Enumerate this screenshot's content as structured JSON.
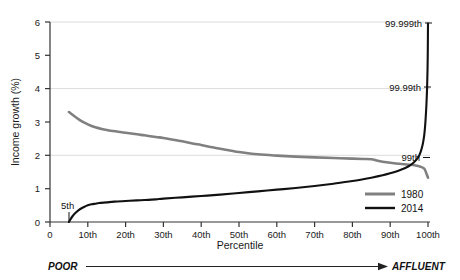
{
  "chart_data": {
    "type": "line",
    "title": "",
    "xlabel": "Percentile",
    "ylabel": "Income growth (%)",
    "xlim": [
      0,
      100
    ],
    "ylim": [
      0,
      6
    ],
    "grid": true,
    "legend_position": "bottom-right",
    "x_ticks": [
      {
        "value": 0,
        "label": "0"
      },
      {
        "value": 10,
        "label": "10th"
      },
      {
        "value": 20,
        "label": "20th"
      },
      {
        "value": 30,
        "label": "30th"
      },
      {
        "value": 40,
        "label": "40th"
      },
      {
        "value": 50,
        "label": "50th"
      },
      {
        "value": 60,
        "label": "60th"
      },
      {
        "value": 70,
        "label": "70th"
      },
      {
        "value": 80,
        "label": "80th"
      },
      {
        "value": 90,
        "label": "90th"
      },
      {
        "value": 100,
        "label": "100th"
      }
    ],
    "y_ticks": [
      {
        "value": 0,
        "label": "0"
      },
      {
        "value": 1,
        "label": "1"
      },
      {
        "value": 2,
        "label": "2"
      },
      {
        "value": 3,
        "label": "3"
      },
      {
        "value": 4,
        "label": "4"
      },
      {
        "value": 5,
        "label": "5"
      },
      {
        "value": 6,
        "label": "6"
      }
    ],
    "gridlines_y": [
      2,
      4,
      6
    ],
    "series": [
      {
        "name": "1980",
        "color": "#808080",
        "x": [
          5,
          8,
          10,
          12,
          14,
          15,
          16,
          18,
          20,
          23,
          25,
          28,
          30,
          33,
          35,
          38,
          40,
          43,
          45,
          48,
          50,
          55,
          60,
          65,
          70,
          75,
          80,
          83,
          85,
          87,
          89,
          91,
          93,
          95,
          96,
          97,
          98,
          99,
          99.5,
          100
        ],
        "values": [
          3.3,
          3.05,
          2.93,
          2.84,
          2.78,
          2.76,
          2.74,
          2.71,
          2.68,
          2.63,
          2.6,
          2.55,
          2.52,
          2.46,
          2.42,
          2.35,
          2.31,
          2.24,
          2.2,
          2.14,
          2.1,
          2.03,
          1.99,
          1.96,
          1.94,
          1.92,
          1.9,
          1.89,
          1.88,
          1.83,
          1.79,
          1.76,
          1.74,
          1.72,
          1.71,
          1.69,
          1.66,
          1.6,
          1.48,
          1.33
        ]
      },
      {
        "name": "2014",
        "color": "#111111",
        "x": [
          5,
          6,
          7,
          8,
          9,
          10,
          11,
          12,
          13,
          15,
          17,
          20,
          23,
          25,
          28,
          30,
          35,
          40,
          45,
          50,
          55,
          60,
          65,
          70,
          75,
          80,
          85,
          88,
          90,
          92,
          94,
          95,
          96,
          97,
          97.6,
          98.1,
          98.5,
          98.8,
          99.05,
          99.25,
          99.4,
          99.55,
          99.65,
          99.75,
          99.82,
          99.88,
          99.92,
          99.95,
          99.97,
          99.985,
          100
        ],
        "values": [
          0.0,
          0.18,
          0.3,
          0.39,
          0.45,
          0.5,
          0.53,
          0.55,
          0.57,
          0.59,
          0.61,
          0.63,
          0.65,
          0.66,
          0.68,
          0.7,
          0.74,
          0.78,
          0.82,
          0.87,
          0.92,
          0.97,
          1.02,
          1.08,
          1.15,
          1.23,
          1.33,
          1.4,
          1.46,
          1.53,
          1.62,
          1.68,
          1.76,
          1.88,
          1.98,
          2.12,
          2.28,
          2.45,
          2.65,
          2.9,
          3.15,
          3.45,
          3.7,
          4.0,
          4.3,
          4.6,
          4.9,
          5.2,
          5.5,
          5.75,
          5.95
        ]
      }
    ],
    "annotations": [
      {
        "name": "5th",
        "label": "5th",
        "x": 5,
        "y": 0.0,
        "position": "above-left"
      },
      {
        "name": "99th",
        "label": "99th",
        "x": 99,
        "y": 1.95,
        "position": "left"
      },
      {
        "name": "99.99th",
        "label": "99.99th",
        "x": 99.95,
        "y": 4.0,
        "position": "left"
      },
      {
        "name": "99.999th",
        "label": "99.999th",
        "x": 100,
        "y": 6.0,
        "position": "left"
      }
    ],
    "scale_bar": {
      "left_label": "POOR",
      "right_label": "AFFLUENT"
    }
  }
}
